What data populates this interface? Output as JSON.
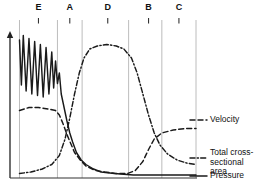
{
  "chart_data": {
    "type": "line",
    "title": "",
    "xlabel": "",
    "ylabel": "",
    "grid": true,
    "legend_position": "right",
    "xlim": [
      0,
      196
    ],
    "ylim": [
      0,
      100
    ],
    "axis_arrow": "up-arrow",
    "segment_labels": [
      {
        "label": "E",
        "x": 30
      },
      {
        "label": "A",
        "x": 63
      },
      {
        "label": "D",
        "x": 103
      },
      {
        "label": "B",
        "x": 146
      },
      {
        "label": "C",
        "x": 178
      }
    ],
    "gridlines_x": [
      10,
      50,
      76,
      125,
      160,
      196
    ],
    "series": [
      {
        "name": "Pressure",
        "style": "solid",
        "color": "#1a1a1a",
        "points": [
          [
            10,
            92
          ],
          [
            12,
            62
          ],
          [
            14,
            95
          ],
          [
            17,
            58
          ],
          [
            20,
            93
          ],
          [
            23,
            56
          ],
          [
            26,
            91
          ],
          [
            29,
            55
          ],
          [
            32,
            89
          ],
          [
            35,
            54
          ],
          [
            38,
            87
          ],
          [
            41,
            56
          ],
          [
            44,
            84
          ],
          [
            46,
            60
          ],
          [
            48,
            78
          ],
          [
            50,
            63
          ],
          [
            52,
            70
          ],
          [
            54,
            56
          ],
          [
            56,
            50
          ],
          [
            58,
            44
          ],
          [
            60,
            38
          ],
          [
            63,
            30
          ],
          [
            66,
            24
          ],
          [
            70,
            17
          ],
          [
            75,
            12
          ],
          [
            80,
            9
          ],
          [
            88,
            6
          ],
          [
            96,
            4
          ],
          [
            110,
            3
          ],
          [
            130,
            2
          ],
          [
            160,
            2
          ],
          [
            196,
            2
          ]
        ]
      },
      {
        "name": "Velocity",
        "style": "dashed",
        "color": "#1a1a1a",
        "points": [
          [
            10,
            45
          ],
          [
            20,
            47
          ],
          [
            30,
            47
          ],
          [
            40,
            46
          ],
          [
            48,
            45
          ],
          [
            52,
            42
          ],
          [
            56,
            36
          ],
          [
            60,
            29
          ],
          [
            64,
            23
          ],
          [
            68,
            17
          ],
          [
            74,
            12
          ],
          [
            80,
            8
          ],
          [
            90,
            5
          ],
          [
            100,
            4
          ],
          [
            112,
            3
          ],
          [
            124,
            3
          ],
          [
            132,
            5
          ],
          [
            140,
            11
          ],
          [
            146,
            19
          ],
          [
            152,
            26
          ],
          [
            160,
            30
          ],
          [
            172,
            32
          ],
          [
            185,
            33
          ],
          [
            196,
            33
          ]
        ]
      },
      {
        "name": "Total cross-sectional area",
        "style": "dash-dot",
        "color": "#1a1a1a",
        "points": [
          [
            10,
            3
          ],
          [
            22,
            4
          ],
          [
            34,
            6
          ],
          [
            44,
            9
          ],
          [
            52,
            15
          ],
          [
            58,
            26
          ],
          [
            63,
            40
          ],
          [
            68,
            56
          ],
          [
            73,
            70
          ],
          [
            78,
            80
          ],
          [
            84,
            86
          ],
          [
            92,
            88
          ],
          [
            102,
            89
          ],
          [
            112,
            88
          ],
          [
            120,
            86
          ],
          [
            128,
            80
          ],
          [
            134,
            70
          ],
          [
            140,
            56
          ],
          [
            146,
            42
          ],
          [
            152,
            30
          ],
          [
            158,
            22
          ],
          [
            166,
            16
          ],
          [
            176,
            12
          ],
          [
            186,
            10
          ],
          [
            196,
            9
          ]
        ]
      }
    ]
  },
  "legend": {
    "items": [
      {
        "label": "Velocity",
        "style": "dashed"
      },
      {
        "label": "Total cross-\nsectional area",
        "style": "dash-dot"
      },
      {
        "label": "Pressure",
        "style": "solid"
      }
    ]
  }
}
